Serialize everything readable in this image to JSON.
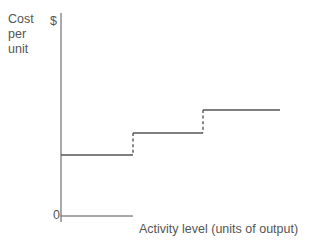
{
  "figure": {
    "background_color": "#ffffff",
    "ink_color": "#555555"
  },
  "axes": {
    "y_axis_label_lines": [
      "Cost",
      "per",
      "unit"
    ],
    "y_axis_label_full": "Cost per unit",
    "currency_symbol": "$",
    "origin_label": "0",
    "x_axis_label": "Activity level (units of output)"
  },
  "chart_data": {
    "type": "line",
    "subtype": "step",
    "title": "",
    "subtitle": "",
    "xlabel": "Activity level (units of output)",
    "ylabel": "Cost per unit",
    "y_unit_symbol": "$",
    "grid": false,
    "legend": null,
    "legend_position": "none",
    "axis_ticks": {
      "x": [
        "0"
      ],
      "y": []
    },
    "xlim": [
      0,
      10
    ],
    "ylim": [
      0,
      10
    ],
    "series": [
      {
        "name": "Step fixed cost",
        "style": "step-post",
        "line_style": "solid",
        "riser_style": "dashed",
        "color": "#555555",
        "steps": [
          {
            "index": 1,
            "x_start": 0.0,
            "x_end": 3.3,
            "y": 3.0
          },
          {
            "index": 2,
            "x_start": 3.3,
            "x_end": 6.6,
            "y": 4.3
          },
          {
            "index": 3,
            "x_start": 6.6,
            "x_end": 10.0,
            "y": 5.6
          }
        ],
        "x": [
          0.0,
          3.3,
          3.3,
          6.6,
          6.6,
          10.0
        ],
        "values": [
          3.0,
          3.0,
          4.3,
          4.3,
          5.6,
          5.6
        ]
      }
    ],
    "pixel_geometry": {
      "y_axis_x": 61,
      "y_axis_top": 13,
      "y_axis_bottom": 222,
      "x_axis_y": 216,
      "x_axis_start": 61,
      "x_axis_end": 133,
      "treads": [
        {
          "y": 155,
          "x_start": 61,
          "x_end": 133
        },
        {
          "y": 133,
          "x_start": 133,
          "x_end": 203
        },
        {
          "y": 110,
          "x_start": 203,
          "x_end": 280
        }
      ],
      "risers": [
        {
          "x": 133,
          "y_top": 133,
          "y_bottom": 155
        },
        {
          "x": 203,
          "y_top": 110,
          "y_bottom": 133
        }
      ]
    }
  }
}
